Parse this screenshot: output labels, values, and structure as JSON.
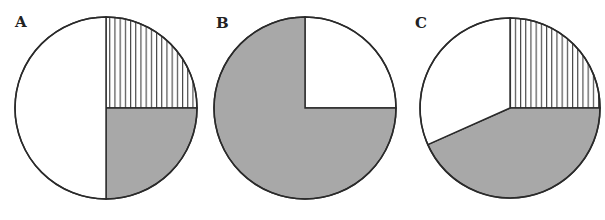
{
  "colors": {
    "outline": "#2a2a2a",
    "gray": "#a8a8a8",
    "white": "#ffffff",
    "stripe": "#2a2a2a"
  },
  "chart_data": [
    {
      "type": "pie",
      "title": "A",
      "label": "A",
      "center": [
        106,
        108
      ],
      "radius": 91,
      "slices": [
        {
          "name": "striped",
          "fill": "vertical-lines",
          "percent": 25,
          "start_deg": 270,
          "end_deg": 360
        },
        {
          "name": "gray",
          "fill": "gray",
          "percent": 25,
          "start_deg": 0,
          "end_deg": 90
        },
        {
          "name": "white",
          "fill": "white",
          "percent": 50,
          "start_deg": 90,
          "end_deg": 270
        }
      ]
    },
    {
      "type": "pie",
      "title": "B",
      "label": "B",
      "center": [
        305,
        108
      ],
      "radius": 91,
      "slices": [
        {
          "name": "white",
          "fill": "white",
          "percent": 25,
          "start_deg": 270,
          "end_deg": 360
        },
        {
          "name": "gray",
          "fill": "gray",
          "percent": 75,
          "start_deg": 0,
          "end_deg": 270
        }
      ]
    },
    {
      "type": "pie",
      "title": "C",
      "label": "C",
      "center": [
        510,
        108
      ],
      "radius": 90,
      "slices": [
        {
          "name": "striped",
          "fill": "vertical-lines",
          "percent": 25,
          "start_deg": 270,
          "end_deg": 360
        },
        {
          "name": "gray",
          "fill": "gray",
          "percent": 43,
          "start_deg": 0,
          "end_deg": 156
        },
        {
          "name": "white",
          "fill": "white",
          "percent": 32,
          "start_deg": 156,
          "end_deg": 270
        }
      ]
    }
  ],
  "labels": {
    "a": "A",
    "b": "B",
    "c": "C"
  }
}
